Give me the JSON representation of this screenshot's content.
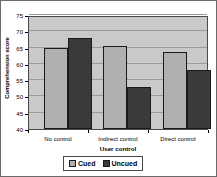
{
  "chart_data": {
    "type": "bar",
    "title": "",
    "xlabel": "User control",
    "ylabel": "Comprehension score",
    "categories": [
      "No control",
      "Indirect control",
      "Direct control"
    ],
    "series": [
      {
        "name": "Cued",
        "values": [
          65,
          65.5,
          63.5
        ],
        "color": "#b0b0b0"
      },
      {
        "name": "Uncued",
        "values": [
          68,
          53,
          58
        ],
        "color": "#3a3a3a"
      }
    ],
    "ylim": [
      40,
      75
    ],
    "yticks": [
      40,
      45,
      50,
      55,
      60,
      65,
      70,
      75
    ],
    "ytick_labels": [
      "40",
      "45",
      "50",
      "55",
      "60",
      "65",
      "70",
      "75"
    ],
    "grid": "horizontal",
    "legend_position": "bottom-center",
    "plot_background": "#c9c9c9",
    "figure_background": "#ffffff"
  },
  "legend": {
    "items": [
      {
        "label": "Cued",
        "swatch": "cued-swatch"
      },
      {
        "label": "Uncued",
        "swatch": "uncued-swatch"
      }
    ]
  }
}
